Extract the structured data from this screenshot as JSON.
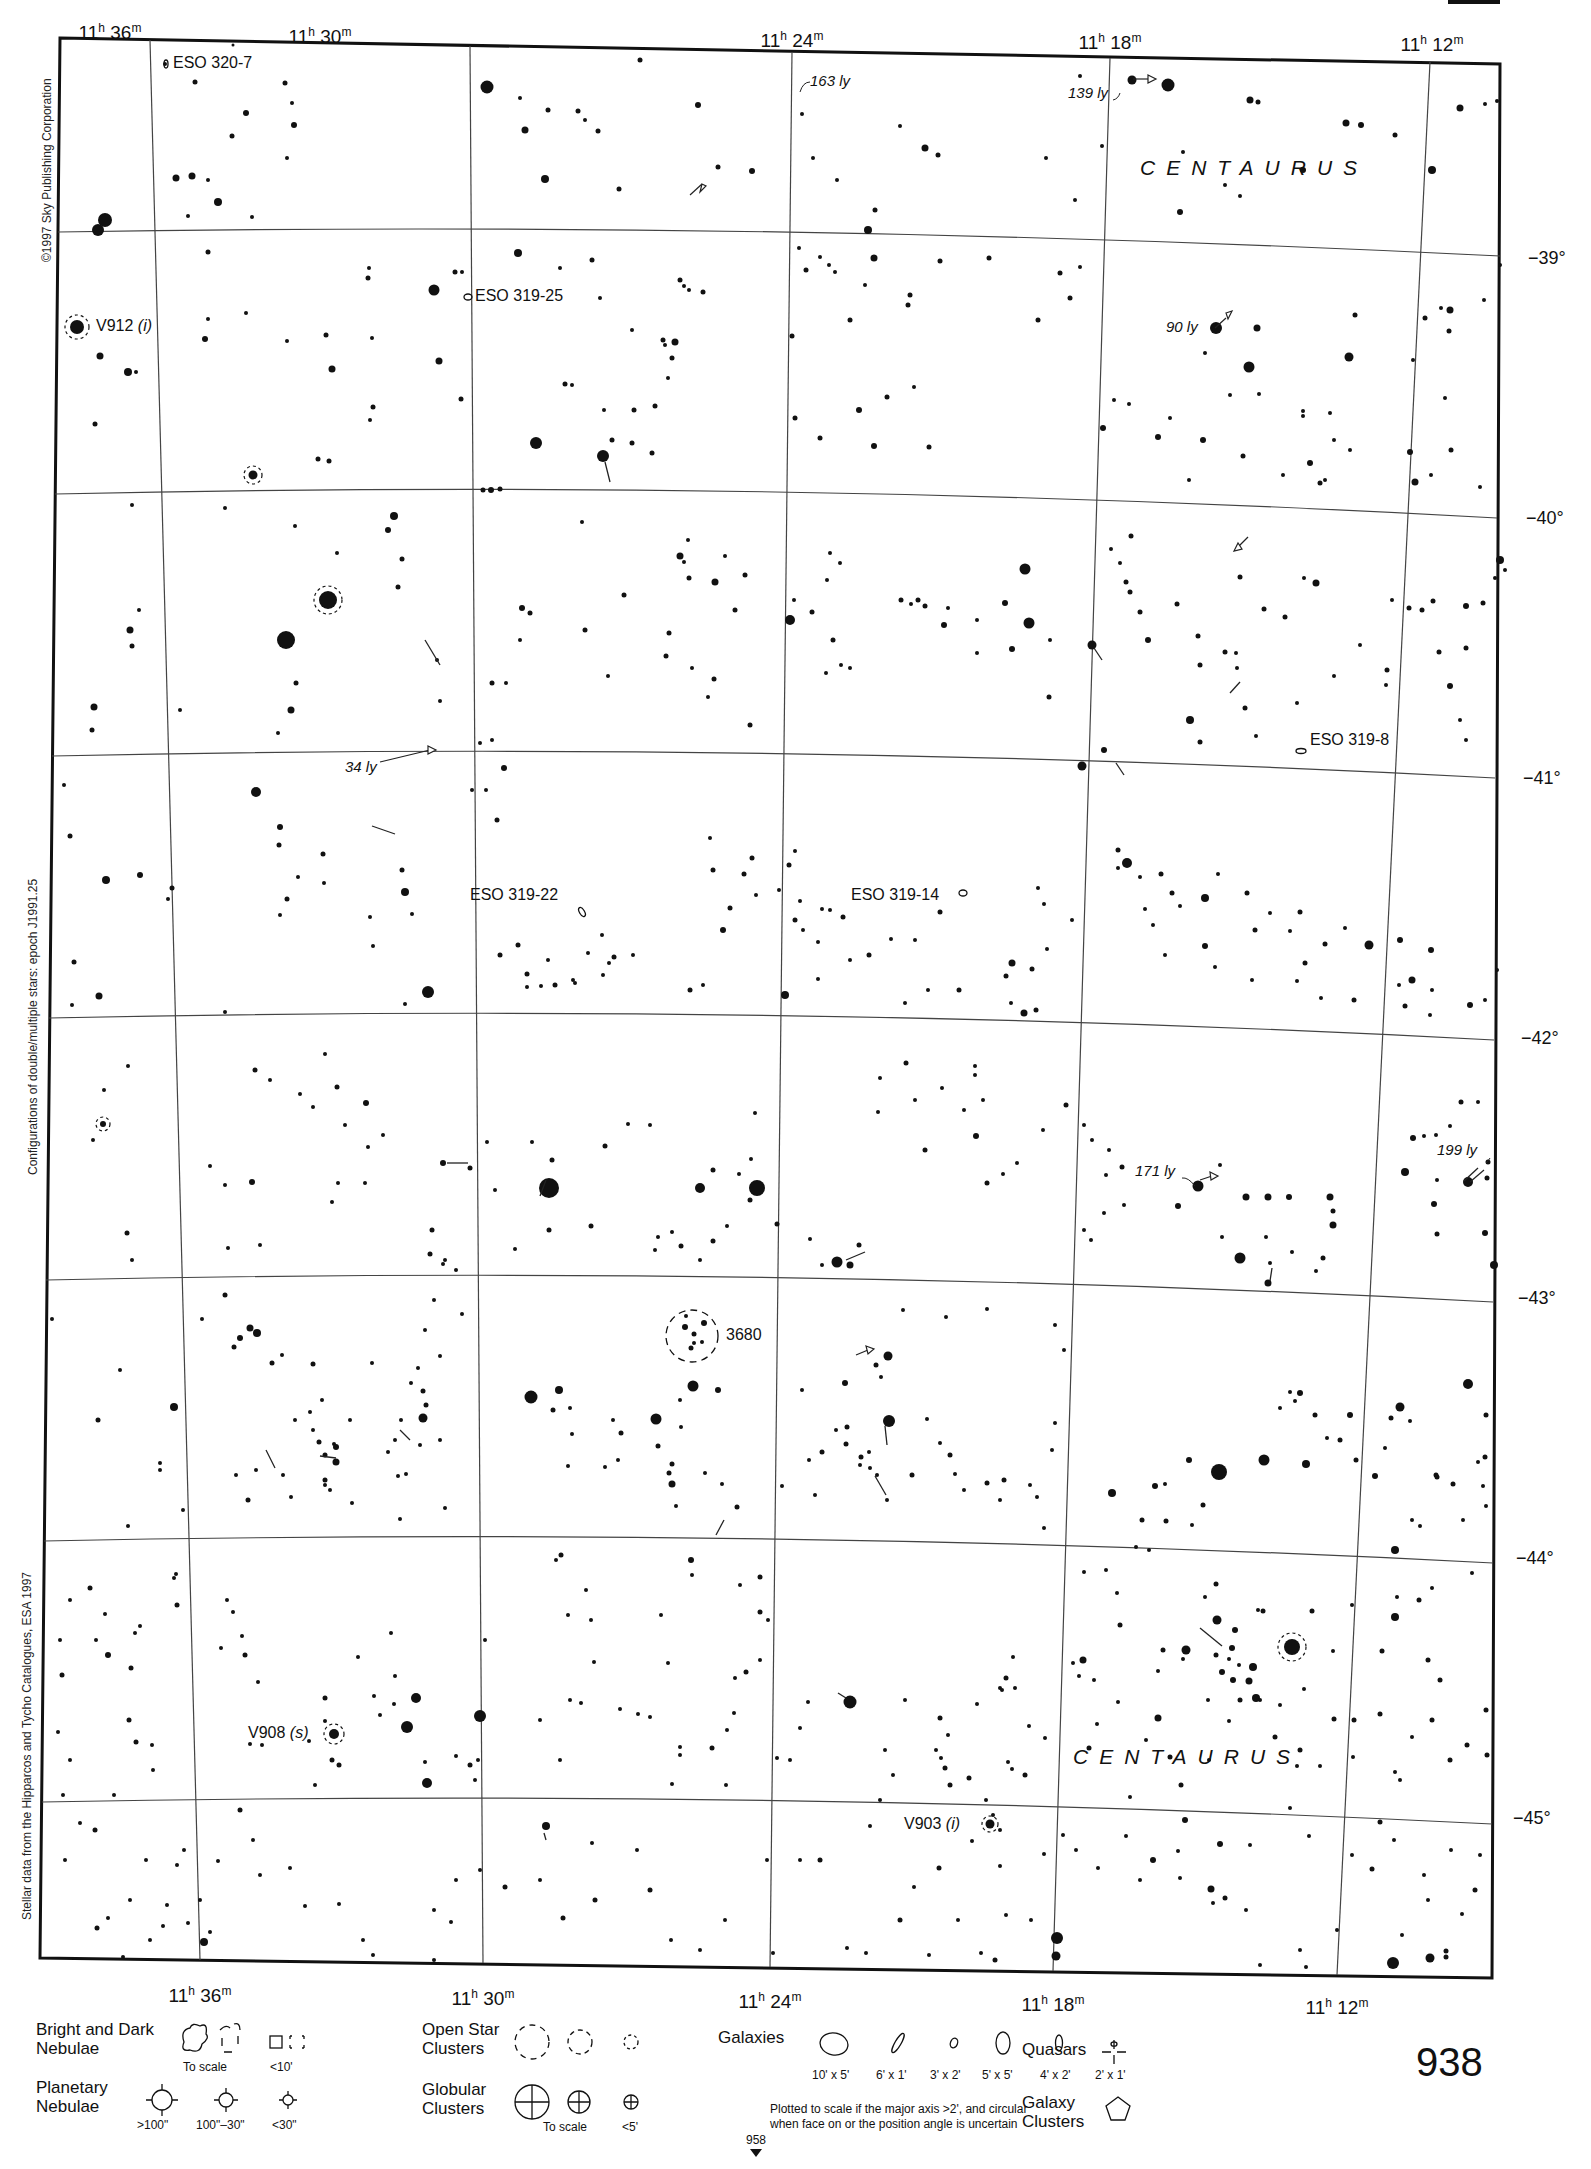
{
  "page": {
    "page_number": "938",
    "adjacent_page_ref": "958",
    "top_tab_fragment": "12"
  },
  "side_notes": {
    "copyright": "©1997 Sky Publishing Corporation",
    "epoch_note": "Configurations of double/multiple stars: epoch J1991.25",
    "data_source": "Stellar data from the Hipparcos and Tycho Catalogues, ESA 1997"
  },
  "axes": {
    "ra_top": [
      {
        "h": "11",
        "m": "36"
      },
      {
        "h": "11",
        "m": "30"
      },
      {
        "h": "11",
        "m": "24"
      },
      {
        "h": "11",
        "m": "18"
      },
      {
        "h": "11",
        "m": "12"
      }
    ],
    "ra_bottom": [
      {
        "h": "11",
        "m": "36"
      },
      {
        "h": "11",
        "m": "30"
      },
      {
        "h": "11",
        "m": "24"
      },
      {
        "h": "11",
        "m": "18"
      },
      {
        "h": "11",
        "m": "12"
      }
    ],
    "dec": [
      "−39°",
      "−40°",
      "−41°",
      "−42°",
      "−43°",
      "−44°",
      "−45°"
    ],
    "ra_unit_h": "h",
    "ra_unit_m": "m"
  },
  "constellations": [
    {
      "name": "CENTAURUS",
      "position": "upper-right"
    },
    {
      "name": "CENTAURUS",
      "position": "lower-right"
    }
  ],
  "deep_sky_objects": [
    {
      "id": "ESO 320-7",
      "type": "galaxy"
    },
    {
      "id": "ESO 319-25",
      "type": "galaxy"
    },
    {
      "id": "ESO 319-22",
      "type": "galaxy"
    },
    {
      "id": "ESO 319-14",
      "type": "galaxy"
    },
    {
      "id": "ESO 319-8",
      "type": "galaxy"
    },
    {
      "id": "3680",
      "type": "open-cluster"
    }
  ],
  "variable_stars": [
    {
      "id": "V912",
      "type": "(i)"
    },
    {
      "id": "V908",
      "type": "(s)"
    },
    {
      "id": "V903",
      "type": "(i)"
    }
  ],
  "distance_labels": [
    "163 ly",
    "139 ly",
    "90 ly",
    "34 ly",
    "171 ly",
    "199 ly"
  ],
  "legend": {
    "nebulae": {
      "title_line1": "Bright and Dark",
      "title_line2": "Nebulae",
      "to_scale": "To scale",
      "small": "<10'"
    },
    "planetary": {
      "title_line1": "Planetary",
      "title_line2": "Nebulae",
      "sizes": [
        ">100\"",
        "100\"–30\"",
        "<30\""
      ]
    },
    "open_clusters": {
      "title_line1": "Open Star",
      "title_line2": "Clusters"
    },
    "globular_clusters": {
      "title_line1": "Globular",
      "title_line2": "Clusters",
      "to_scale": "To scale",
      "small": "<5'"
    },
    "galaxies": {
      "title": "Galaxies",
      "sizes": [
        "10' x 5'",
        "6' x 1'",
        "3' x 2'",
        "5' x 5'",
        "4' x 2'",
        "2' x 1'"
      ],
      "note_line1": "Plotted to scale if the major axis >2', and circular",
      "note_line2": "when face on or the position angle is uncertain"
    },
    "quasars": {
      "title": "Quasars"
    },
    "galaxy_clusters": {
      "title_line1": "Galaxy",
      "title_line2": "Clusters"
    }
  },
  "colors": {
    "ink": "#111111",
    "paper": "#ffffff",
    "grid": "#444444"
  }
}
